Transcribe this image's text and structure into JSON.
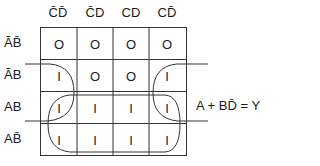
{
  "kmap": {
    "columns": [
      {
        "text": "CD",
        "overline": "CD"
      },
      {
        "text": "CD",
        "overline": "C"
      },
      {
        "text": "CD",
        "overline": ""
      },
      {
        "text": "CD",
        "overline": "D"
      }
    ],
    "column_labels": [
      "C̄D̄",
      "C̄D",
      "CD",
      "CD̄"
    ],
    "row_labels": [
      "ĀB̄",
      "ĀB",
      "AB",
      "AB̄"
    ],
    "cells": [
      [
        "0",
        "0",
        "0",
        "0"
      ],
      [
        "1",
        "0",
        "0",
        "1"
      ],
      [
        "1",
        "1",
        "1",
        "1"
      ],
      [
        "1",
        "1",
        "1",
        "1"
      ]
    ],
    "cell_display": [
      [
        "O",
        "O",
        "O",
        "O"
      ],
      [
        "I",
        "O",
        "O",
        "I"
      ],
      [
        "I",
        "I",
        "I",
        "I"
      ],
      [
        "I",
        "I",
        "I",
        "I"
      ]
    ]
  },
  "groupings": [
    {
      "name": "A",
      "cells": "rows AB and AB̄ (bottom two rows)"
    },
    {
      "name": "BD̄",
      "cells": "corners of rows ĀB and AB at columns C̄D̄ and CD̄ (wraparound)"
    }
  ],
  "equation": "A + BD̄ = Y"
}
